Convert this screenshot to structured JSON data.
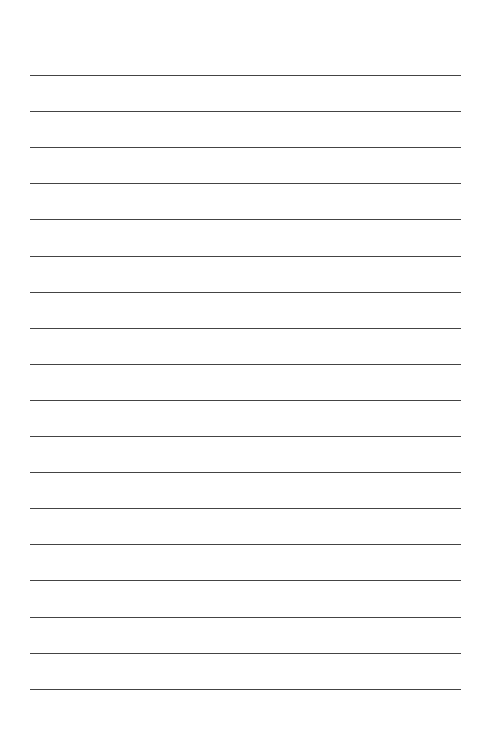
{
  "page": {
    "type": "lined-paper",
    "line_count": 18,
    "line_color": "#444444",
    "background_color": "#ffffff",
    "line_left": 30,
    "line_right": 461,
    "first_line_y": 75,
    "line_spacing": 36.1,
    "text": ""
  }
}
